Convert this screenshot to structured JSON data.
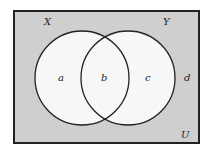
{
  "diagram": {
    "type": "venn",
    "universe_label": "U",
    "sets": [
      {
        "name": "X",
        "label": "X"
      },
      {
        "name": "Y",
        "label": "Y"
      }
    ],
    "regions": {
      "only_x": "a",
      "intersection": "b",
      "only_y": "c",
      "outside": "d"
    },
    "colors": {
      "background": "#cfcfcf",
      "circle_fill": "#f7f7f7",
      "stroke": "#222222"
    }
  }
}
